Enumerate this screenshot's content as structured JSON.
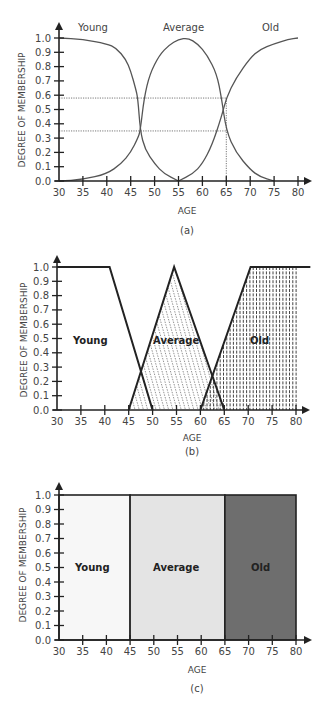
{
  "chart_data": [
    {
      "id": "a",
      "type": "line",
      "title": "",
      "caption": "(a)",
      "xlabel": "AGE",
      "ylabel": "DEGREE OF MEMBERSHIP",
      "xlim": [
        30,
        80
      ],
      "ylim": [
        0,
        1
      ],
      "x_ticks": [
        "30",
        "35",
        "40",
        "45",
        "50",
        "55",
        "60",
        "65",
        "70",
        "75",
        "80"
      ],
      "y_ticks": [
        "0.0",
        "0.1",
        "0.2",
        "0.3",
        "0.4",
        "0.5",
        "0.6",
        "0.7",
        "0.8",
        "0.9",
        "1.0"
      ],
      "grid": false,
      "series": [
        {
          "name": "Young",
          "x": [
            30,
            35,
            40,
            42,
            44,
            45,
            46,
            46.5,
            47,
            48,
            50,
            52,
            55
          ],
          "values": [
            1.0,
            0.99,
            0.96,
            0.93,
            0.85,
            0.77,
            0.65,
            0.58,
            0.35,
            0.22,
            0.12,
            0.05,
            0.0
          ]
        },
        {
          "name": "Average",
          "x": [
            30,
            35,
            40,
            43,
            45,
            46.5,
            47,
            47.8,
            49,
            51,
            53,
            55,
            57,
            59,
            61,
            63,
            64,
            65,
            67,
            70,
            72,
            75
          ],
          "values": [
            0.0,
            0.01,
            0.05,
            0.12,
            0.2,
            0.3,
            0.35,
            0.58,
            0.75,
            0.88,
            0.95,
            0.99,
            1.0,
            0.96,
            0.88,
            0.75,
            0.58,
            0.35,
            0.2,
            0.08,
            0.03,
            0.0
          ]
        },
        {
          "name": "Old",
          "x": [
            55,
            58,
            60,
            62,
            64,
            65,
            67,
            70,
            72,
            75,
            78,
            80
          ],
          "values": [
            0.0,
            0.05,
            0.12,
            0.25,
            0.45,
            0.58,
            0.72,
            0.86,
            0.92,
            0.96,
            0.99,
            1.0
          ]
        }
      ],
      "annotations": [
        {
          "type": "hline",
          "y": 0.58,
          "x_end": 65,
          "style": "dotted"
        },
        {
          "type": "hline",
          "y": 0.35,
          "x_end": 65,
          "style": "dotted"
        },
        {
          "type": "vline",
          "x": 65,
          "y_end": 0.58,
          "style": "dotted"
        }
      ],
      "legend_labels": [
        "Young",
        "Average",
        "Old"
      ]
    },
    {
      "id": "b",
      "type": "area",
      "caption": "(b)",
      "xlabel": "AGE",
      "ylabel": "DEGREE OF MEMBERSHIP",
      "xlim": [
        30,
        80
      ],
      "ylim": [
        0,
        1
      ],
      "x_ticks": [
        "30",
        "35",
        "40",
        "45",
        "50",
        "55",
        "60",
        "65",
        "70",
        "75",
        "80"
      ],
      "y_ticks": [
        "0.0",
        "0.1",
        "0.2",
        "0.3",
        "0.4",
        "0.5",
        "0.6",
        "0.7",
        "0.8",
        "0.9",
        "1.0"
      ],
      "grid": false,
      "series": [
        {
          "name": "Young",
          "shape": "trapezoid",
          "x": [
            30,
            41,
            50
          ],
          "values": [
            1.0,
            1.0,
            0.0
          ],
          "fill": "none"
        },
        {
          "name": "Average",
          "shape": "triangle",
          "x": [
            45,
            54.5,
            65
          ],
          "values": [
            0.0,
            1.0,
            0.0
          ],
          "fill": "diagonal-dotted-hatch"
        },
        {
          "name": "Old",
          "shape": "trapezoid",
          "x": [
            60,
            70.5,
            83
          ],
          "values": [
            0.0,
            1.0,
            1.0
          ],
          "fill": "vertical-dashed-hatch"
        }
      ],
      "legend_labels": [
        "Young",
        "Average",
        "Old"
      ]
    },
    {
      "id": "c",
      "type": "bar",
      "caption": "(c)",
      "xlabel": "AGE",
      "ylabel": "DEGREE OF MEMBERSHIP",
      "xlim": [
        30,
        80
      ],
      "ylim": [
        0,
        1
      ],
      "x_ticks": [
        "30",
        "35",
        "40",
        "45",
        "50",
        "55",
        "60",
        "65",
        "70",
        "75",
        "80"
      ],
      "y_ticks": [
        "0.0",
        "0.1",
        "0.2",
        "0.3",
        "0.4",
        "0.5",
        "0.6",
        "0.7",
        "0.8",
        "0.9",
        "1.0"
      ],
      "grid": false,
      "categories": [
        "Young",
        "Average",
        "Old"
      ],
      "ranges": [
        [
          30,
          45
        ],
        [
          45,
          65
        ],
        [
          65,
          80
        ]
      ],
      "values": [
        1.0,
        1.0,
        1.0
      ],
      "colors": [
        "#f7f7f7",
        "#e4e4e4",
        "#6e6e6e"
      ]
    }
  ],
  "labels": {
    "ylabel": "DEGREE OF MEMBERSHIP",
    "xlabel": "AGE",
    "young": "Young",
    "average": "Average",
    "old": "Old",
    "caption_a": "(a)",
    "caption_b": "(b)",
    "caption_c": "(c)"
  },
  "ticks": {
    "x": [
      "30",
      "35",
      "40",
      "45",
      "50",
      "55",
      "60",
      "65",
      "70",
      "75",
      "80"
    ],
    "y": [
      "0.0",
      "0.1",
      "0.2",
      "0.3",
      "0.4",
      "0.5",
      "0.6",
      "0.7",
      "0.8",
      "0.9",
      "1.0"
    ]
  }
}
